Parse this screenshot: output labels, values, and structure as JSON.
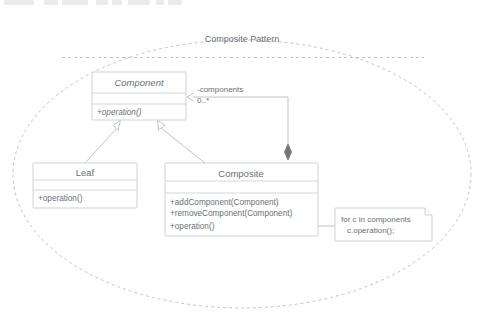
{
  "toolbar": {
    "visible_fragment": true,
    "chips": [
      {
        "x": 4,
        "w": 30
      },
      {
        "x": 44,
        "w": 14
      },
      {
        "x": 62,
        "w": 26
      },
      {
        "x": 96,
        "w": 12
      },
      {
        "x": 112,
        "w": 10
      },
      {
        "x": 128,
        "w": 22
      },
      {
        "x": 156,
        "w": 8
      },
      {
        "x": 168,
        "w": 14
      }
    ]
  },
  "diagram": {
    "type": "uml-class-diagram",
    "package": {
      "name": "package-boundary",
      "title": "Composite Pattern",
      "shape": "ellipse",
      "border_style": "dashed"
    },
    "colors": {
      "line": "#b9bcc2",
      "box_border": "#c9ccd1",
      "text": "#6a7076",
      "fill": "#ffffff",
      "diamond_fill": "#6f7479"
    },
    "classes": [
      {
        "id": "component",
        "name": "Component",
        "abstract": true,
        "attributes": [],
        "operations": [
          "+operation()"
        ]
      },
      {
        "id": "leaf",
        "name": "Leaf",
        "abstract": false,
        "attributes": [],
        "operations": [
          "+operation()"
        ]
      },
      {
        "id": "composite",
        "name": "Composite",
        "abstract": false,
        "attributes": [],
        "operations": [
          "+addComponent(Component)",
          "+removeComponent(Component)",
          "+operation()"
        ]
      }
    ],
    "relationships": [
      {
        "id": "leaf-generalization",
        "type": "generalization",
        "from": "leaf",
        "to": "component",
        "arrowhead": "hollow-triangle"
      },
      {
        "id": "composite-generalization",
        "type": "generalization",
        "from": "composite",
        "to": "component",
        "arrowhead": "hollow-triangle"
      },
      {
        "id": "composite-aggregation",
        "type": "composition",
        "from": "composite",
        "to": "component",
        "arrowhead": "filled-diamond",
        "role_label": "-components",
        "multiplicity": "0..*"
      }
    ],
    "note": {
      "id": "operation-note",
      "anchor": "composite.+operation()",
      "lines": [
        "for c in components",
        "c.operation();"
      ]
    }
  }
}
